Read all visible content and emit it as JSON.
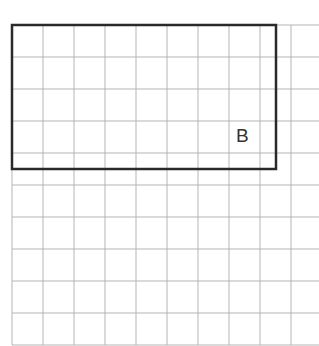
{
  "diagram": {
    "type": "grid-with-rectangle",
    "grid": {
      "origin_x": 12,
      "origin_y": 25,
      "cell_w": 31,
      "cell_h": 32,
      "cols": 10,
      "rows": 10,
      "right_edge": 319,
      "line_color": "#b5b5b5"
    },
    "rectangle": {
      "label": "B",
      "x": 12,
      "y": 25,
      "width": 264,
      "height": 144,
      "stroke": "#2a2a2a",
      "stroke_width": 2.5
    },
    "label_pos": {
      "left": 236,
      "top": 125
    }
  }
}
